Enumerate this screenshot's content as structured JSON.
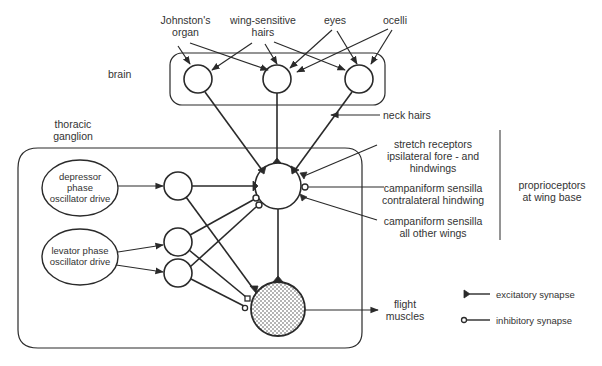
{
  "sensory_inputs": {
    "johnstons_organ": "Johnston's\norgan",
    "johnstons_organ_l1": "Johnston's",
    "johnstons_organ_l2": "organ",
    "wing_hairs_l1": "wing-sensitive",
    "wing_hairs_l2": "hairs",
    "eyes": "eyes",
    "ocelli": "ocelli",
    "neck_hairs": "neck hairs"
  },
  "regions": {
    "brain": "brain",
    "thoracic_l1": "thoracic",
    "thoracic_l2": "ganglion"
  },
  "drives": {
    "depressor_l1": "depressor",
    "depressor_l2": "phase",
    "depressor_l3": "oscillator drive",
    "levator_l1": "levator phase",
    "levator_l2": "oscillator drive"
  },
  "proprioceptors": {
    "stretch_l1": "stretch receptors",
    "stretch_l2": "ipsilateral fore - and",
    "stretch_l3": "hindwings",
    "campa_contra_l1": "campaniform sensilla",
    "campa_contra_l2": "contralateral hindwing",
    "campa_all_l1": "campaniform sensilla",
    "campa_all_l2": "all other wings",
    "group_l1": "proprioceptors",
    "group_l2": "at wing base"
  },
  "output": {
    "l1": "flight",
    "l2": "muscles"
  },
  "legend": {
    "excitatory": "excitatory synapse",
    "inhibitory": "inhibitory synapse"
  },
  "colors": {
    "line": "#2a2a2a",
    "background": "#ffffff",
    "stipple": "#555555"
  }
}
